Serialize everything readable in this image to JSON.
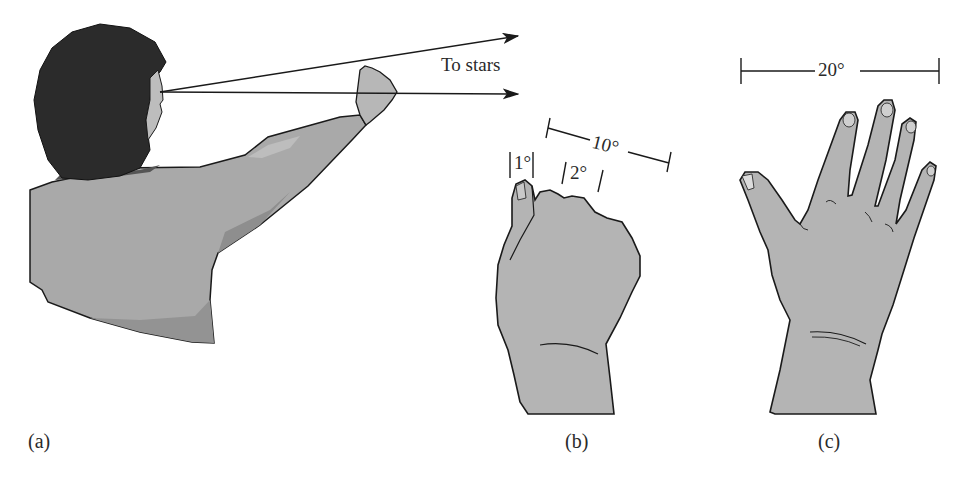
{
  "figure": {
    "panels": [
      {
        "id": "a",
        "label": "(a)",
        "description": "Person with arm outstretched, fist held against sky"
      },
      {
        "id": "b",
        "label": "(b)",
        "description": "Closed fist held at arm's length"
      },
      {
        "id": "c",
        "label": "(c)",
        "description": "Outstretched hand with spread fingers"
      }
    ],
    "arrow_label": "To stars",
    "measurements": {
      "little_finger": "1°",
      "three_knuckles": "2°",
      "fist_width": "10°",
      "hand_span": "20°"
    },
    "colors": {
      "skin_gray": "#b4b4b4",
      "hair": "#2b2b2b",
      "shirt": "#a9a9a9",
      "shirt_shadow": "#8e8e8e",
      "outline": "#1a1a1a",
      "background": "#ffffff"
    }
  }
}
